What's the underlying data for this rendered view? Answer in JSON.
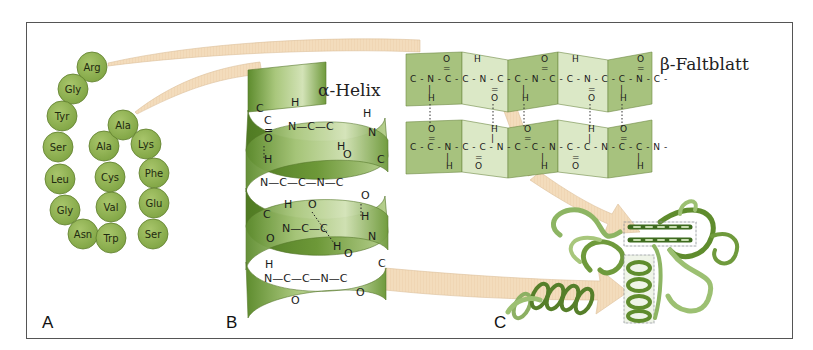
{
  "figure": {
    "panels": [
      {
        "id": "A",
        "label": "A",
        "description": "Primärstruktur (amino acid chain)"
      },
      {
        "id": "B",
        "label": "B",
        "title": "α-Helix"
      },
      {
        "id": "C",
        "label": "C",
        "description": "Tertiärstruktur"
      }
    ],
    "beta_sheet": {
      "title": "β-Faltblatt"
    },
    "amino_acids": [
      {
        "name": "Arg",
        "x": 92,
        "y": 67
      },
      {
        "name": "Gly",
        "x": 73,
        "y": 89
      },
      {
        "name": "Tyr",
        "x": 62,
        "y": 116
      },
      {
        "name": "Ser",
        "x": 58,
        "y": 147
      },
      {
        "name": "Leu",
        "x": 60,
        "y": 179
      },
      {
        "name": "Gly",
        "x": 65,
        "y": 210
      },
      {
        "name": "Asn",
        "x": 83,
        "y": 234
      },
      {
        "name": "Trp",
        "x": 111,
        "y": 238
      },
      {
        "name": "Val",
        "x": 111,
        "y": 207
      },
      {
        "name": "Cys",
        "x": 110,
        "y": 177
      },
      {
        "name": "Ala",
        "x": 104,
        "y": 146
      },
      {
        "name": "Ala",
        "x": 123,
        "y": 125
      },
      {
        "name": "Lys",
        "x": 146,
        "y": 144
      },
      {
        "name": "Phe",
        "x": 154,
        "y": 173
      },
      {
        "name": "Glu",
        "x": 154,
        "y": 203
      },
      {
        "name": "Ser",
        "x": 153,
        "y": 234
      }
    ],
    "helix_chem": [
      {
        "text": "C",
        "x": 256,
        "y": 112
      },
      {
        "text": "H",
        "x": 291,
        "y": 106
      },
      {
        "text": "C",
        "x": 264,
        "y": 124
      },
      {
        "text": "N—C—C",
        "x": 288,
        "y": 130
      },
      {
        "text": "H",
        "x": 363,
        "y": 117
      },
      {
        "text": "N",
        "x": 368,
        "y": 136
      },
      {
        "text": "O",
        "x": 264,
        "y": 142
      },
      {
        "text": "=",
        "x": 264,
        "y": 134
      },
      {
        "text": "O",
        "x": 343,
        "y": 158
      },
      {
        "text": "H",
        "x": 337,
        "y": 150
      },
      {
        "text": "C",
        "x": 377,
        "y": 163
      },
      {
        "text": "H",
        "x": 264,
        "y": 163
      },
      {
        "text": "N—C—C—N—C",
        "x": 260,
        "y": 186
      },
      {
        "text": "O",
        "x": 361,
        "y": 199
      },
      {
        "text": "H",
        "x": 284,
        "y": 208
      },
      {
        "text": "O",
        "x": 308,
        "y": 208
      },
      {
        "text": "H",
        "x": 361,
        "y": 220
      },
      {
        "text": "C",
        "x": 263,
        "y": 218
      },
      {
        "text": "N—C—C",
        "x": 282,
        "y": 232
      },
      {
        "text": "N",
        "x": 368,
        "y": 240
      },
      {
        "text": "O",
        "x": 266,
        "y": 242
      },
      {
        "text": "H",
        "x": 333,
        "y": 250
      },
      {
        "text": "O",
        "x": 344,
        "y": 257
      },
      {
        "text": "C",
        "x": 378,
        "y": 267
      },
      {
        "text": "H",
        "x": 265,
        "y": 268
      },
      {
        "text": "N—C—C—N—C",
        "x": 264,
        "y": 282
      },
      {
        "text": "O",
        "x": 291,
        "y": 304
      },
      {
        "text": "O",
        "x": 356,
        "y": 296
      }
    ],
    "beta_strands": {
      "top": {
        "main": "C - N - C - C - N - C - C - N - C - C - N - C - C - N - C -",
        "above": [
          "O",
          "H",
          "O",
          "H",
          "O"
        ],
        "below": [
          "H",
          "O",
          "H",
          "O",
          "H"
        ]
      },
      "bottom": {
        "main": "C - C - N - C - C - N - C - C - N - C - C - N - C - C - N -",
        "above": [
          "O",
          "H",
          "O",
          "H",
          "O"
        ],
        "below": [
          "H",
          "O",
          "H",
          "O",
          "H"
        ]
      }
    },
    "colors": {
      "residue_fill": "#8db04f",
      "residue_stroke": "#5e7d2c",
      "helix_dark": "#5e8c2e",
      "helix_light": "#c9dcaa",
      "sheet_dark": "#a7c27e",
      "sheet_light": "#dbe8c6",
      "arrow_fill": "#f3dcbc",
      "arrow_stroke": "#d9b98c",
      "frame": "#555555"
    }
  }
}
